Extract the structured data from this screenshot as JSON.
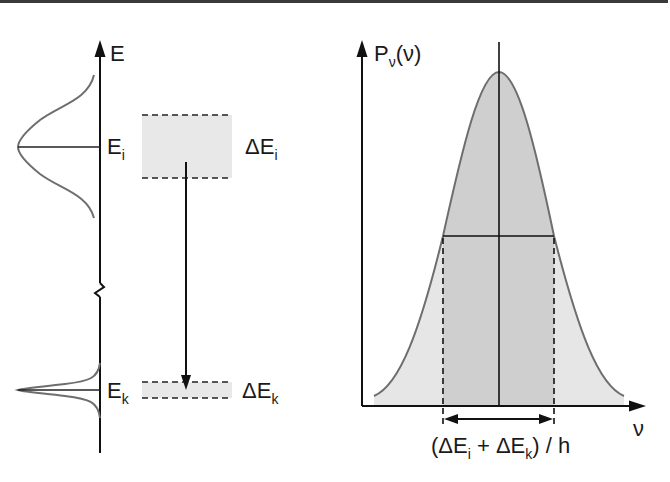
{
  "diagram": {
    "colors": {
      "line": "#111111",
      "curve": "#6e6e6e",
      "fill_light": "#e6e6e6",
      "fill_dark": "#cfcfcf",
      "box_fill": "#e8e8e8",
      "border": "#3a3a3a"
    },
    "left_panel": {
      "axis_label": "E",
      "upper_level": {
        "label_main": "E",
        "label_sub": "i",
        "width_label_main": "ΔE",
        "width_label_sub": "i"
      },
      "lower_level": {
        "label_main": "E",
        "label_sub": "k",
        "width_label_main": "ΔE",
        "width_label_sub": "k"
      },
      "transition": "downward arrow from upper level band to lower level band",
      "axis_break": true
    },
    "right_panel": {
      "y_axis_label_main": "P",
      "y_axis_label_sub": "ν",
      "y_axis_label_arg": "(ν)",
      "x_axis_label": "ν",
      "width_label": {
        "open": "(ΔE",
        "sub1": "i",
        "plus": " + ΔE",
        "sub2": "k",
        "close": ") / h"
      },
      "profile": "bell-shaped line profile with center line and full width at half maximum marked"
    }
  }
}
